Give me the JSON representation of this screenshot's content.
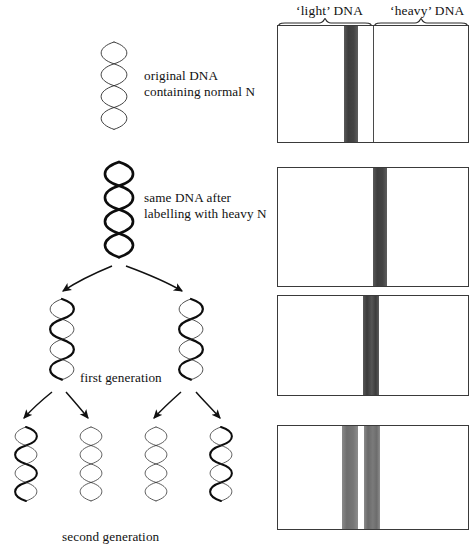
{
  "figure": {
    "headers": {
      "light": "‘light’ DNA",
      "heavy": "‘heavy’ DNA"
    },
    "stage_labels": [
      {
        "id": "original",
        "line1": "original DNA",
        "line2": "containing normal N"
      },
      {
        "id": "labelled",
        "line1": "same DNA after",
        "line2": "labelling with heavy N"
      },
      {
        "id": "first_gen",
        "line1": "first generation",
        "line2": ""
      },
      {
        "id": "second_gen",
        "line1": "second generation",
        "line2": ""
      }
    ],
    "panels": [
      {
        "id": "panel-original",
        "caption": "original DNA containing normal N",
        "bands": [
          {
            "name": "light-band",
            "left_pct": 35.5,
            "width_pct": 7.0,
            "color": "#4d4d4d"
          }
        ]
      },
      {
        "id": "panel-labelled",
        "caption": "same DNA after labelling with heavy N",
        "bands": [
          {
            "name": "heavy-band",
            "left_pct": 50.5,
            "width_pct": 7.0,
            "color": "#4d4d4d"
          }
        ]
      },
      {
        "id": "panel-first-generation",
        "caption": "first generation",
        "bands": [
          {
            "name": "hybrid-band",
            "left_pct": 45.0,
            "width_pct": 7.5,
            "color": "#3f3f3f"
          }
        ]
      },
      {
        "id": "panel-second-generation",
        "caption": "second generation",
        "bands": [
          {
            "name": "light-band",
            "left_pct": 34.0,
            "width_pct": 8.0,
            "color": "#7a7a7a"
          },
          {
            "name": "hybrid-band",
            "left_pct": 45.0,
            "width_pct": 8.0,
            "color": "#7a7a7a"
          }
        ]
      }
    ],
    "helix_key": {
      "thin_strand": "normal N (light) strand",
      "thick_strand": "heavy N (labelled) strand"
    },
    "colors": {
      "ink": "#111111",
      "panel_border": "#3a3a3a",
      "band_dark": "#4d4d4d",
      "band_mid": "#7a7a7a",
      "background": "#ffffff"
    }
  }
}
